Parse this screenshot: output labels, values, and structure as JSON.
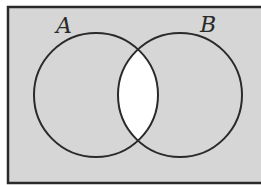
{
  "diagram": {
    "type": "venn",
    "colors": {
      "shaded": "#d6d6d6",
      "unshaded": "#ffffff",
      "stroke": "#2a2a2a"
    },
    "sets": [
      {
        "label": "A",
        "cx": 96,
        "cy": 95,
        "r": 62,
        "label_x": 56,
        "label_y": 33
      },
      {
        "label": "B",
        "cx": 180,
        "cy": 95,
        "r": 62,
        "label_x": 200,
        "label_y": 32
      }
    ],
    "universe": {
      "x": 8,
      "y": 7,
      "width": 262,
      "height": 176
    },
    "shaded_region": "complement of A ∩ B",
    "unshaded_region": "A ∩ B"
  }
}
